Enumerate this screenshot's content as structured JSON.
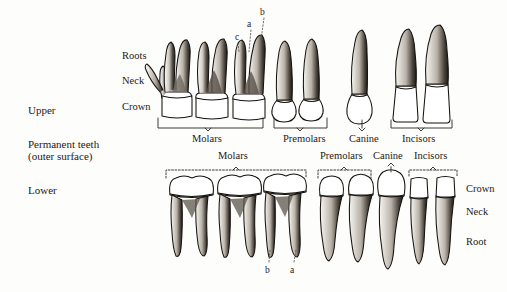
{
  "figure": {
    "title_block": {
      "upper_label": "Upper",
      "caption_line1": "Permanent teeth",
      "caption_line2": "(outer surface)",
      "lower_label": "Lower"
    },
    "upper_structure_labels": [
      {
        "key": "roots",
        "text": "Roots"
      },
      {
        "key": "neck",
        "text": "Neck"
      },
      {
        "key": "crown",
        "text": "Crown"
      }
    ],
    "lower_structure_labels": [
      {
        "key": "crown",
        "text": "Crown"
      },
      {
        "key": "neck",
        "text": "Neck"
      },
      {
        "key": "root",
        "text": "Root"
      }
    ],
    "upper_groups": [
      {
        "key": "molars",
        "text": "Molars",
        "count": 3
      },
      {
        "key": "premolars",
        "text": "Premolars",
        "count": 2
      },
      {
        "key": "canine",
        "text": "Canine",
        "count": 1
      },
      {
        "key": "incisors",
        "text": "Incisors",
        "count": 2
      }
    ],
    "lower_groups": [
      {
        "key": "molars",
        "text": "Molars",
        "count": 3
      },
      {
        "key": "premolars",
        "text": "Premolars",
        "count": 2
      },
      {
        "key": "canine",
        "text": "Canine",
        "count": 1
      },
      {
        "key": "incisors",
        "text": "Incisors",
        "count": 2
      }
    ],
    "upper_callouts": [
      {
        "key": "a",
        "text": "a"
      },
      {
        "key": "b",
        "text": "b"
      },
      {
        "key": "c",
        "text": "c"
      }
    ],
    "lower_callouts": [
      {
        "key": "b",
        "text": "b"
      },
      {
        "key": "a",
        "text": "a"
      }
    ],
    "colors": {
      "background": "#fdfdfb",
      "ink": "#1d1a17",
      "outline": "#15120f",
      "shading": "#4a443c",
      "enamel": "#ffffff",
      "bracket": "#2a2621"
    }
  }
}
